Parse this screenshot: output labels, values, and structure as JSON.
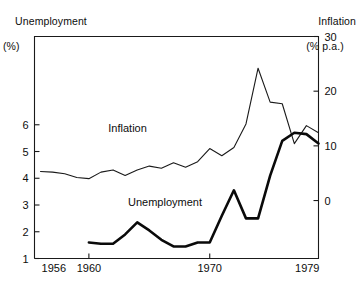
{
  "chart_data": {
    "type": "line",
    "title": "",
    "subtitle": "",
    "xlabel": "",
    "grid": false,
    "legend_position": "inline-annotations",
    "axes": {
      "left": {
        "name": "Unemployment",
        "unit": "(%)",
        "label": "Unemployment",
        "unit_label": "(%)",
        "ticks": [
          1,
          2,
          3,
          4,
          5,
          6
        ],
        "tick_labels": [
          "1",
          "2",
          "3",
          "4",
          "5",
          "6"
        ],
        "range": [
          1,
          9.3
        ]
      },
      "right": {
        "name": "Inflation",
        "unit": "(% p.a.)",
        "label": "Inflation",
        "unit_label": "(% p.a.)",
        "ticks": [
          0,
          10,
          20,
          30
        ],
        "tick_labels": [
          "0",
          "10",
          "20",
          "30"
        ],
        "range": [
          -10.6,
          30
        ]
      },
      "bottom": {
        "ticks": [
          1956,
          1960,
          1970,
          1979
        ],
        "tick_labels": [
          "1956",
          "1960",
          "1970",
          "1979"
        ],
        "range": [
          1955.5,
          1979
        ]
      }
    },
    "x": [
      1956,
      1957,
      1958,
      1959,
      1960,
      1961,
      1962,
      1963,
      1964,
      1965,
      1966,
      1967,
      1968,
      1969,
      1970,
      1971,
      1972,
      1973,
      1974,
      1975,
      1976,
      1977,
      1978,
      1979
    ],
    "series": [
      {
        "name": "Inflation",
        "label": "Inflation",
        "unit": "% p.a.",
        "axis": "right",
        "style": "thin",
        "x": [
          1956,
          1957,
          1958,
          1959,
          1960,
          1961,
          1962,
          1963,
          1964,
          1965,
          1966,
          1967,
          1968,
          1969,
          1970,
          1971,
          1972,
          1973,
          1974,
          1975,
          1976,
          1977,
          1978,
          1979
        ],
        "values": [
          5.3,
          5.2,
          4.9,
          4.2,
          4.0,
          5.2,
          5.6,
          4.6,
          5.6,
          6.3,
          5.9,
          6.9,
          6.1,
          7.1,
          9.5,
          8.2,
          9.7,
          14.0,
          24.2,
          18.0,
          17.7,
          10.4,
          13.7,
          12.4
        ]
      },
      {
        "name": "Unemployment",
        "label": "Unemployment",
        "unit": "%",
        "axis": "left",
        "style": "thick",
        "x": [
          1960,
          1961,
          1962,
          1963,
          1964,
          1965,
          1966,
          1967,
          1968,
          1969,
          1970,
          1971,
          1972,
          1973,
          1974,
          1975,
          1976,
          1977,
          1978,
          1979
        ],
        "values": [
          1.6,
          1.55,
          1.55,
          1.9,
          2.35,
          2.05,
          1.7,
          1.45,
          1.45,
          1.6,
          1.6,
          2.6,
          3.55,
          2.5,
          2.5,
          4.1,
          5.4,
          5.7,
          5.65,
          5.3
        ]
      }
    ],
    "annotations": [
      {
        "name": "inflation-label",
        "text": "Inflation",
        "x": 1963.2,
        "y_axis": "right",
        "y": 12.6
      },
      {
        "name": "unemployment-label",
        "text": "Unemployment",
        "x": 1966.3,
        "y_axis": "left",
        "y": 2.95
      }
    ]
  },
  "colors": {
    "background": "#ffffff",
    "ink": "#1a1a1a",
    "inflation_line": "#1a1a1a",
    "unemployment_line": "#0a0a0a"
  }
}
